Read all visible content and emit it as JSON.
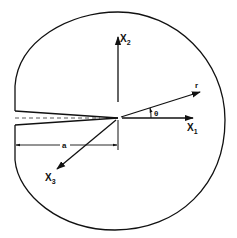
{
  "diagram": {
    "labels": {
      "x1": "X",
      "x1_sub": "1",
      "x2": "X",
      "x2_sub": "2",
      "x3": "X",
      "x3_sub": "3",
      "r": "r",
      "theta": "θ",
      "a": "a"
    },
    "colors": {
      "stroke": "#111111",
      "background": "#ffffff"
    }
  }
}
